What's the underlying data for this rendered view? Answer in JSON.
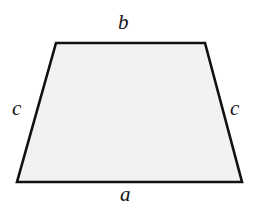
{
  "figure": {
    "name": "trapezoid-diagram",
    "shape_type": "isosceles trapezoid",
    "background_color": "#ffffff",
    "fill_color": "#f2f2f2",
    "stroke_color": "#111111",
    "stroke_width": 2.6,
    "vertices": {
      "top_left": [
        56,
        43
      ],
      "top_right": [
        205,
        43
      ],
      "bottom_right": [
        242,
        182
      ],
      "bottom_left": [
        17,
        182
      ]
    },
    "polygon_points": "56,43 205,43 242,182 17,182"
  },
  "labels": {
    "top": "b",
    "bottom": "a",
    "left_leg": "c",
    "right_leg": "c"
  }
}
